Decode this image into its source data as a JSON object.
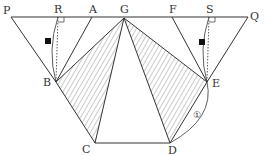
{
  "diagram": {
    "type": "geometry-figure",
    "labels": {
      "P": "P",
      "R": "R",
      "A": "A",
      "G": "G",
      "F": "F",
      "S": "S",
      "Q": "Q",
      "B": "B",
      "E": "E",
      "C": "C",
      "D": "D"
    },
    "arc_label": "①",
    "points": {
      "P": [
        11,
        17
      ],
      "R": [
        58,
        17
      ],
      "A": [
        92,
        17
      ],
      "G": [
        124,
        18
      ],
      "F": [
        172,
        17
      ],
      "S": [
        209,
        17
      ],
      "Q": [
        248,
        17
      ],
      "B": [
        56,
        82
      ],
      "E": [
        207,
        82
      ],
      "C": [
        95,
        143
      ],
      "D": [
        170,
        143
      ]
    },
    "segments": [
      [
        "P",
        "Q"
      ],
      [
        "P",
        "B"
      ],
      [
        "B",
        "A"
      ],
      [
        "Q",
        "E"
      ],
      [
        "E",
        "F"
      ],
      [
        "B",
        "G"
      ],
      [
        "G",
        "C"
      ],
      [
        "B",
        "C"
      ],
      [
        "C",
        "D"
      ],
      [
        "G",
        "E"
      ],
      [
        "G",
        "D"
      ],
      [
        "E",
        "D"
      ]
    ],
    "hatched_triangles": [
      [
        "G",
        "B",
        "C"
      ],
      [
        "G",
        "E",
        "D"
      ]
    ],
    "dotted_perpendiculars": [
      [
        "R",
        "B"
      ],
      [
        "S",
        "E"
      ]
    ],
    "arcs": [
      [
        "R",
        "B"
      ],
      [
        "S",
        "E"
      ],
      [
        "E",
        "D"
      ]
    ],
    "markers": [
      "filled-square near arc R-B",
      "filled-square near arc S-E",
      "right-angle at R",
      "right-angle at S"
    ],
    "colors": {
      "stroke": "#333333",
      "hatch": "#555555",
      "background": "#ffffff"
    }
  }
}
